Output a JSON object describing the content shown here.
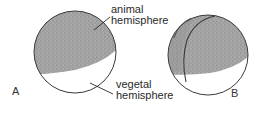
{
  "figure": {
    "panels": [
      {
        "id": "A",
        "label": "A",
        "description": "Egg with pigmented animal hemisphere and unpigmented vegetal hemisphere"
      },
      {
        "id": "B",
        "label": "B",
        "description": "Egg after first cleavage furrow begins at animal pole"
      }
    ],
    "annotations": {
      "animal": {
        "line1": "animal",
        "line2": "hemisphere"
      },
      "vegetal": {
        "line1": "vegetal",
        "line2": "hemisphere"
      }
    },
    "colors": {
      "outline": "#3a3a3a",
      "pigment": "#9a9a9a",
      "pigment_dark": "#7a7a7a",
      "background": "#ffffff",
      "text": "#2a2a2a"
    }
  }
}
